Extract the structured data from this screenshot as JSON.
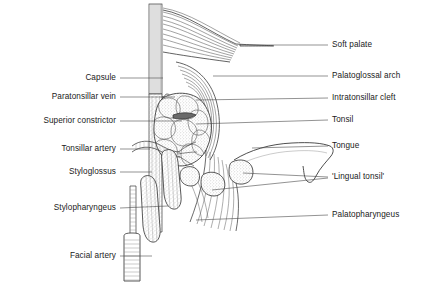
{
  "figure": {
    "background_color": "#ffffff",
    "line_color": "#2b2b2b",
    "text_color": "#1a1a1a",
    "width": 428,
    "height": 287
  },
  "labels_left": [
    {
      "id": "capsule",
      "text": "Capsule",
      "text_right_x": 116,
      "y": 78,
      "leader_end_x": 163
    },
    {
      "id": "paratonsillar-vein",
      "text": "Paratonsillar vein",
      "text_right_x": 116,
      "y": 97,
      "leader_end_x": 175
    },
    {
      "id": "superior-constrictor",
      "text": "Superior constrictor",
      "text_right_x": 116,
      "y": 121,
      "leader_end_x": 182
    },
    {
      "id": "tonsillar-artery",
      "text": "Tonsillar artery",
      "text_right_x": 116,
      "y": 149,
      "leader_end_x": 150
    },
    {
      "id": "styloglossus",
      "text": "Styloglossus",
      "text_right_x": 116,
      "y": 172,
      "leader_end_x": 152
    },
    {
      "id": "stylopharyngeus",
      "text": "Stylopharyngeus",
      "text_right_x": 116,
      "y": 208,
      "leader_end_x": 168
    },
    {
      "id": "facial-artery",
      "text": "Facial artery",
      "text_right_x": 116,
      "y": 256,
      "leader_end_x": 152
    }
  ],
  "labels_right": [
    {
      "id": "soft-palate",
      "text": "Soft palate",
      "text_left_x": 332,
      "y": 45,
      "leader_start_x": 240
    },
    {
      "id": "palatoglossal-arch",
      "text": "Palatoglossal arch",
      "text_left_x": 332,
      "y": 76,
      "leader_start_x": 213
    },
    {
      "id": "intratonsillar-cleft",
      "text": "Intratonsillar cleft",
      "text_left_x": 332,
      "y": 98,
      "leader_start_x": 196
    },
    {
      "id": "tonsil",
      "text": "Tonsil",
      "text_left_x": 332,
      "y": 120,
      "leader_start_x": 196
    },
    {
      "id": "tongue",
      "text": "Tongue",
      "text_left_x": 332,
      "y": 146,
      "leader_start_x": 252
    },
    {
      "id": "lingual-tonsil",
      "text": "'Lingual tonsil'",
      "text_left_x": 332,
      "y": 177,
      "leader_start_x": 243
    },
    {
      "id": "palatopharyngeus",
      "text": "Palatopharyngeus",
      "text_left_x": 332,
      "y": 215,
      "leader_start_x": 196
    }
  ],
  "leaders_left": [
    {
      "id": "leader-capsule",
      "x1": 120,
      "y1": 78,
      "x2": 163,
      "y2": 78
    },
    {
      "id": "leader-paratonsillar-vein",
      "x1": 120,
      "y1": 97,
      "x2": 175,
      "y2": 97
    },
    {
      "id": "leader-superior-constrictor",
      "x1": 120,
      "y1": 121,
      "x2": 182,
      "y2": 121
    },
    {
      "id": "leader-tonsillar-artery",
      "x1": 120,
      "y1": 149,
      "x2": 150,
      "y2": 149
    },
    {
      "id": "leader-styloglossus",
      "x1": 120,
      "y1": 172,
      "x2": 152,
      "y2": 172
    },
    {
      "id": "leader-stylopharyngeus",
      "x1": 120,
      "y1": 208,
      "x2": 168,
      "y2": 206
    },
    {
      "id": "leader-facial-artery",
      "x1": 120,
      "y1": 256,
      "x2": 152,
      "y2": 256
    }
  ],
  "leaders_right": [
    {
      "id": "leader-soft-palate",
      "x1": 240,
      "y1": 45,
      "x2": 328,
      "y2": 45
    },
    {
      "id": "leader-palatoglossal-arch",
      "x1": 213,
      "y1": 76,
      "x2": 328,
      "y2": 76
    },
    {
      "id": "leader-intratonsillar-cleft",
      "x1": 196,
      "y1": 100,
      "x2": 328,
      "y2": 98
    },
    {
      "id": "leader-tonsil",
      "x1": 196,
      "y1": 124,
      "x2": 328,
      "y2": 120
    },
    {
      "id": "leader-tongue",
      "x1": 252,
      "y1": 148,
      "x2": 328,
      "y2": 146
    },
    {
      "id": "leader-lingual-tonsil-a",
      "x1": 243,
      "y1": 173,
      "x2": 328,
      "y2": 177
    },
    {
      "id": "leader-lingual-tonsil-b",
      "x1": 212,
      "y1": 190,
      "x2": 328,
      "y2": 178
    },
    {
      "id": "leader-palatopharyngeus",
      "x1": 196,
      "y1": 220,
      "x2": 328,
      "y2": 215
    }
  ]
}
